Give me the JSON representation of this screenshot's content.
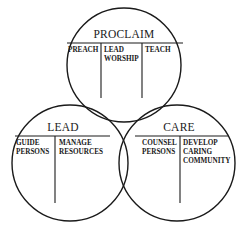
{
  "diagram": {
    "type": "venn",
    "colors": {
      "line": "#1a1a1a",
      "background": "#ffffff"
    },
    "circles": [
      {
        "id": "proclaim",
        "title": "PROCLAIM",
        "columns": [
          {
            "lines": [
              "PREACH"
            ]
          },
          {
            "lines": [
              "LEAD",
              "WORSHIP"
            ]
          },
          {
            "lines": [
              "TEACH"
            ]
          }
        ]
      },
      {
        "id": "lead",
        "title": "LEAD",
        "columns": [
          {
            "lines": [
              "GUIDE",
              "PERSONS"
            ]
          },
          {
            "lines": [
              "MANAGE",
              "RESOURCES"
            ]
          }
        ]
      },
      {
        "id": "care",
        "title": "CARE",
        "columns": [
          {
            "lines": [
              "COUNSEL",
              "PERSONS"
            ]
          },
          {
            "lines": [
              "DEVELOP",
              "CARING",
              "COMMUNITY"
            ]
          }
        ]
      }
    ]
  }
}
